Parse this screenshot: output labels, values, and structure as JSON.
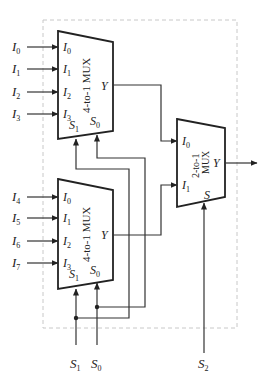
{
  "diagram": {
    "type": "8-to-1 multiplexer built from two 4-to-1 MUXes and one 2-to-1 MUX",
    "colors": {
      "wire": "#333333",
      "block_border": "#222222",
      "enclosure_dash": "#c8c8c8"
    },
    "top_mux": {
      "name": "4-to-1 MUX",
      "external_inputs": [
        {
          "main": "I",
          "sub": "0"
        },
        {
          "main": "I",
          "sub": "1"
        },
        {
          "main": "I",
          "sub": "2"
        },
        {
          "main": "I",
          "sub": "3"
        }
      ],
      "pins": [
        {
          "main": "I",
          "sub": "0"
        },
        {
          "main": "I",
          "sub": "1"
        },
        {
          "main": "I",
          "sub": "2"
        },
        {
          "main": "I",
          "sub": "3"
        }
      ],
      "sel_pins": [
        {
          "main": "S",
          "sub": "1"
        },
        {
          "main": "S",
          "sub": "0"
        }
      ],
      "output": "Y"
    },
    "bottom_mux": {
      "name": "4-to-1 MUX",
      "external_inputs": [
        {
          "main": "I",
          "sub": "4"
        },
        {
          "main": "I",
          "sub": "5"
        },
        {
          "main": "I",
          "sub": "6"
        },
        {
          "main": "I",
          "sub": "7"
        }
      ],
      "pins": [
        {
          "main": "I",
          "sub": "0"
        },
        {
          "main": "I",
          "sub": "1"
        },
        {
          "main": "I",
          "sub": "2"
        },
        {
          "main": "I",
          "sub": "3"
        }
      ],
      "sel_pins": [
        {
          "main": "S",
          "sub": "1"
        },
        {
          "main": "S",
          "sub": "0"
        }
      ],
      "output": "Y"
    },
    "final_mux": {
      "name_line1": "2-to-1",
      "name_line2": "MUX",
      "pins": [
        {
          "main": "I",
          "sub": "0"
        },
        {
          "main": "I",
          "sub": "1"
        }
      ],
      "sel_pin": "S",
      "output": "Y"
    },
    "select_inputs": [
      {
        "main": "S",
        "sub": "1"
      },
      {
        "main": "S",
        "sub": "0"
      },
      {
        "main": "S",
        "sub": "2"
      }
    ]
  }
}
